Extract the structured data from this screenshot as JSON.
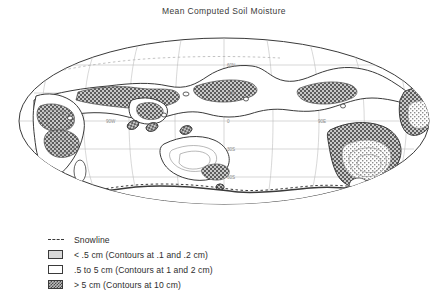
{
  "figure": {
    "title": "Mean Computed Soil Moisture",
    "projection": "elliptical world map (Mollweide-type)"
  },
  "map": {
    "graticule": {
      "latitude_labels": [
        "60N",
        "30N",
        "0",
        "30S",
        "60S"
      ],
      "longitude_labels": [
        "90W",
        "90E"
      ],
      "center_meridian_label": "0"
    }
  },
  "legend": {
    "items": [
      {
        "marker": "dashed-line",
        "label": "Snowline"
      },
      {
        "marker": "light-gray-swatch",
        "label": "< .5 cm (Contours at .1 and .2 cm)"
      },
      {
        "marker": "white-swatch",
        "label": ".5 to 5 cm (Contours at 1 and 2 cm)"
      },
      {
        "marker": "hatched-swatch",
        "label": "> 5 cm (Contours at 10 cm)"
      }
    ]
  },
  "colors": {
    "ink": "#2b2b2b",
    "outline": "#3a3a3a",
    "graticule": "#b0b0b0",
    "fill_low": "#d9d9d9",
    "fill_mid": "#ffffff",
    "fill_high": "#9a9a9a",
    "background": "#ffffff"
  }
}
